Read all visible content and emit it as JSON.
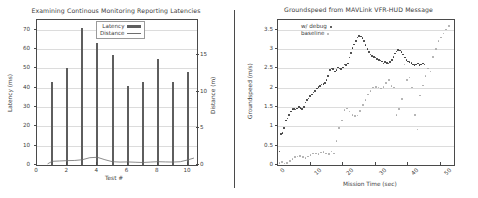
{
  "chart_data": [
    {
      "type": "bar",
      "title": "Examining Continous Monitoring Reporting Latencies",
      "xlabel": "Test #",
      "ylabel": "Latency (ms)",
      "y2label": "Distance (m)",
      "xlim": [
        0,
        10.6
      ],
      "ylim": [
        0,
        75
      ],
      "y2lim": [
        0,
        19.8
      ],
      "grid": true,
      "legend_position": "upper right",
      "xticks": [
        0,
        2,
        4,
        6,
        8,
        10
      ],
      "xticklabels": [
        "0",
        "2",
        "4",
        "6",
        "8",
        "10"
      ],
      "yticks": [
        0,
        10,
        20,
        30,
        40,
        50,
        60,
        70
      ],
      "yticklabels": [
        "0",
        "10",
        "20",
        "30",
        "40",
        "50",
        "60",
        "70"
      ],
      "y2ticks": [
        0,
        5,
        10,
        15
      ],
      "y2ticklabels": [
        "0",
        "5",
        "10",
        "15"
      ],
      "categories": [
        1,
        2,
        3,
        4,
        5,
        6,
        7,
        8,
        9,
        10
      ],
      "series": [
        {
          "name": "Latency",
          "kind": "bar",
          "axis": "left",
          "color": "#5e5e5e",
          "values": [
            43,
            50,
            71,
            63,
            57,
            41,
            43,
            55,
            43,
            48
          ]
        },
        {
          "name": "Distance",
          "kind": "line",
          "axis": "right",
          "color": "#6e6e6e",
          "x": [
            0.7,
            1,
            1.5,
            2,
            2.5,
            3,
            3.5,
            4,
            4.5,
            5,
            5.5,
            6,
            6.5,
            7,
            7.5,
            8,
            8.5,
            9,
            9.5,
            10,
            10.4
          ],
          "values": [
            0.15,
            0.5,
            0.55,
            0.6,
            0.62,
            0.72,
            1.0,
            1.05,
            0.72,
            0.45,
            0.4,
            0.42,
            0.38,
            0.34,
            0.4,
            0.45,
            0.42,
            0.4,
            0.45,
            0.7,
            0.95
          ]
        }
      ]
    },
    {
      "type": "scatter",
      "title": "Groundspeed from MAVLink VFR-HUD Message",
      "xlabel": "Mission Time (sec)",
      "ylabel": "Groundspeed (m/s)",
      "xlim": [
        0,
        54
      ],
      "ylim": [
        0,
        3.75
      ],
      "grid": true,
      "legend_position": "upper left",
      "xticks": [
        0,
        10,
        20,
        30,
        40,
        50
      ],
      "xticklabels": [
        "0",
        "10",
        "20",
        "30",
        "40",
        "50"
      ],
      "yticks": [
        0,
        0.5,
        1,
        1.5,
        2,
        2.5,
        3,
        3.5
      ],
      "yticklabels": [
        "0",
        "0.5",
        "1",
        "1.5",
        "2",
        "2.5",
        "3",
        "3.5"
      ],
      "series": [
        {
          "name": "w/ debug",
          "kind": "scatter",
          "color": "#2e2e2e",
          "x": [
            0.4,
            0.9,
            1.4,
            1.9,
            2.4,
            2.9,
            3.4,
            3.9,
            4.4,
            4.9,
            5.4,
            5.9,
            6.4,
            6.9,
            7.4,
            7.9,
            8.4,
            8.9,
            9.4,
            9.9,
            10.4,
            10.9,
            11.4,
            11.9,
            12.4,
            12.9,
            13.4,
            13.9,
            14.4,
            14.9,
            15.4,
            15.9,
            16.4,
            16.9,
            17.4,
            17.9,
            18.4,
            18.9,
            19.4,
            19.9,
            20.4,
            20.9,
            21.4,
            21.9,
            22.4,
            22.9,
            23.4,
            23.9,
            24.4,
            24.9,
            25.4,
            25.9,
            26.4,
            26.9,
            27.4,
            27.9,
            28.4,
            28.9,
            29.4,
            29.9,
            30.4,
            30.9,
            31.4,
            31.9,
            32.4,
            32.9,
            33.4,
            33.9,
            34.4,
            34.9,
            35.4,
            35.9,
            36.4,
            36.9,
            37.4,
            37.9,
            38.4,
            38.9,
            39.4,
            39.9,
            40.4,
            40.9,
            41.4,
            41.9,
            42.4,
            42.9,
            43.4,
            43.9,
            44.4,
            44.9
          ],
          "values": [
            0.35,
            0.8,
            0.82,
            0.95,
            1.15,
            1.2,
            1.3,
            1.38,
            1.45,
            1.45,
            1.44,
            1.46,
            1.5,
            1.48,
            1.45,
            1.5,
            1.62,
            1.68,
            1.72,
            1.78,
            1.82,
            1.88,
            1.92,
            1.98,
            2.02,
            2.05,
            2.08,
            2.1,
            2.12,
            2.2,
            2.3,
            2.45,
            2.5,
            2.48,
            2.42,
            2.46,
            2.52,
            2.5,
            2.48,
            2.52,
            2.6,
            2.58,
            2.62,
            2.78,
            2.9,
            3.02,
            3.12,
            3.2,
            3.3,
            3.34,
            3.32,
            3.28,
            3.2,
            3.1,
            3.0,
            2.92,
            2.86,
            2.82,
            2.8,
            2.78,
            2.74,
            2.72,
            2.7,
            2.68,
            2.62,
            2.66,
            2.64,
            2.62,
            2.66,
            2.72,
            2.8,
            2.88,
            2.94,
            2.98,
            2.96,
            2.92,
            2.86,
            2.78,
            2.72,
            2.68,
            2.66,
            2.64,
            2.6,
            2.58,
            2.6,
            2.62,
            2.58,
            2.6,
            2.62,
            2.6
          ]
        },
        {
          "name": "baseline",
          "kind": "scatter",
          "color": "#a8a8a8",
          "x": [
            0.4,
            1.2,
            2.0,
            2.8,
            3.6,
            4.4,
            5.2,
            6.0,
            6.8,
            7.6,
            8.4,
            9.2,
            10.0,
            10.8,
            11.6,
            12.4,
            13.2,
            14.0,
            14.8,
            15.6,
            16.4,
            17.2,
            18.0,
            18.8,
            19.6,
            20.4,
            21.2,
            22.0,
            22.8,
            23.6,
            24.4,
            25.2,
            26.0,
            26.8,
            27.6,
            28.4,
            29.2,
            30.0,
            30.8,
            31.6,
            32.4,
            33.2,
            34.0,
            34.8,
            35.6,
            36.4,
            37.2,
            38.0,
            38.8,
            39.6,
            40.4,
            41.2,
            42.0,
            42.8,
            43.6,
            44.4,
            45.2,
            46.0,
            46.8,
            47.6,
            48.4,
            49.2,
            50.0,
            50.8,
            51.6,
            52.4
          ],
          "values": [
            0.05,
            0.08,
            0.04,
            0.05,
            0.1,
            0.15,
            0.2,
            0.22,
            0.24,
            0.2,
            0.18,
            0.22,
            0.26,
            0.3,
            0.3,
            0.28,
            0.32,
            0.34,
            0.3,
            0.28,
            0.35,
            0.3,
            0.62,
            0.95,
            1.15,
            1.42,
            1.46,
            1.38,
            1.3,
            1.26,
            1.28,
            1.4,
            1.55,
            1.68,
            1.82,
            1.92,
            2.0,
            2.02,
            2.0,
            1.98,
            2.02,
            2.12,
            2.2,
            2.04,
            2.0,
            1.3,
            1.45,
            1.7,
            2.6,
            2.2,
            2.26,
            2.0,
            1.3,
            0.92,
            1.8,
            2.06,
            2.3,
            2.5,
            2.42,
            2.8,
            3.0,
            3.2,
            3.3,
            3.4,
            3.5,
            3.6
          ]
        }
      ]
    }
  ]
}
